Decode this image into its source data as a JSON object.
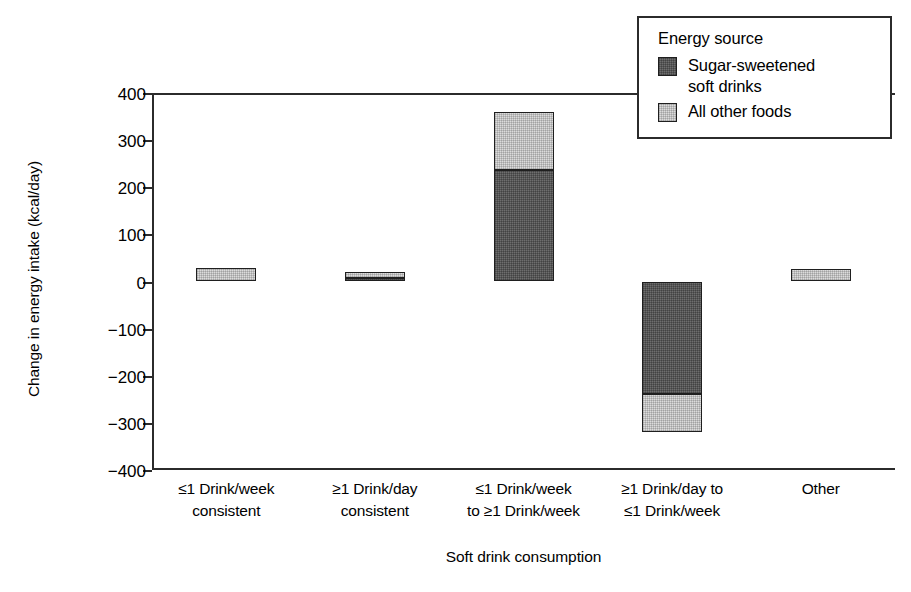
{
  "chart_data": {
    "type": "bar",
    "stacked": true,
    "title": "",
    "xlabel": "Soft drink consumption",
    "ylabel": "Change in energy intake (kcal/day)",
    "ylim": [
      -400,
      400
    ],
    "yticks": [
      400,
      300,
      200,
      100,
      0,
      -100,
      -200,
      -300,
      -400
    ],
    "ytick_labels": [
      "400",
      "300",
      "200",
      "100",
      "0",
      "−100",
      "−200",
      "−300",
      "−400"
    ],
    "grid": false,
    "legend": {
      "title": "Energy source",
      "position": "top-right",
      "entries": [
        {
          "name": "Sugar-sweetened soft drinks",
          "line1": "Sugar-sweetened",
          "line2": "soft drinks",
          "color": "#6e6e6e"
        },
        {
          "name": "All other foods",
          "line1": "All other foods",
          "line2": "",
          "color": "#dcdcdc"
        }
      ]
    },
    "categories": [
      {
        "line1": "≤1 Drink/week",
        "line2": "consistent"
      },
      {
        "line1": "≥1 Drink/day",
        "line2": "consistent"
      },
      {
        "line1": "≤1 Drink/week",
        "line2": "to ≥1 Drink/week"
      },
      {
        "line1": "≥1 Drink/day to",
        "line2": "≤1 Drink/week"
      },
      {
        "line1": "Other",
        "line2": ""
      }
    ],
    "series": [
      {
        "name": "Sugar-sweetened soft drinks",
        "values": [
          0,
          8,
          237,
          -239,
          0
        ]
      },
      {
        "name": "All other foods",
        "values": [
          29,
          13,
          123,
          -81,
          26
        ]
      }
    ],
    "totals": [
      29,
      21,
      360,
      -320,
      26
    ]
  }
}
